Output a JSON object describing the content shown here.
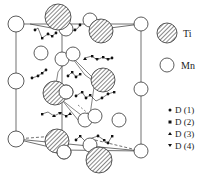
{
  "figure": {
    "type": "crystal-structure-diagram"
  },
  "legend": {
    "atoms": [
      {
        "key": "ti",
        "label": "Ti",
        "style": "hatched"
      },
      {
        "key": "mn",
        "label": "Mn",
        "style": "open"
      }
    ],
    "sites": [
      {
        "key": "d1",
        "label": "D (1)",
        "marker": "circle"
      },
      {
        "key": "d2",
        "label": "D (2)",
        "marker": "square"
      },
      {
        "key": "d3",
        "label": "D (3)",
        "marker": "triangle-up"
      },
      {
        "key": "d4",
        "label": "D (4)",
        "marker": "triangle-down"
      }
    ]
  },
  "colors": {
    "line": "#333333",
    "hatch": "#555555",
    "fill": "#ffffff"
  }
}
